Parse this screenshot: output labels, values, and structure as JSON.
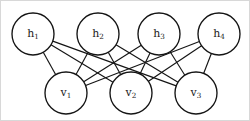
{
  "figure": {
    "background_color": "#ffffff",
    "border_color": "#d8d8d8",
    "stroke_color": "#141414"
  },
  "graph_data": {
    "type": "bipartite-graph",
    "layers": [
      {
        "name": "hidden",
        "y": 33,
        "radius": 21,
        "nodes": [
          {
            "id": "h1",
            "base": "h",
            "sub": "1",
            "x": 32,
            "y": 33
          },
          {
            "id": "h2",
            "base": "h",
            "sub": "2",
            "x": 97,
            "y": 33
          },
          {
            "id": "h3",
            "base": "h",
            "sub": "3",
            "x": 158,
            "y": 33
          },
          {
            "id": "h4",
            "base": "h",
            "sub": "4",
            "x": 218,
            "y": 33
          }
        ]
      },
      {
        "name": "visible",
        "y": 92,
        "radius": 21,
        "nodes": [
          {
            "id": "v1",
            "base": "v",
            "sub": "1",
            "x": 65,
            "y": 92
          },
          {
            "id": "v2",
            "base": "v",
            "sub": "2",
            "x": 130,
            "y": 92
          },
          {
            "id": "v3",
            "base": "v",
            "sub": "3",
            "x": 195,
            "y": 92
          }
        ]
      }
    ],
    "edges": [
      {
        "from": "h1",
        "to": "v1"
      },
      {
        "from": "h1",
        "to": "v2"
      },
      {
        "from": "h1",
        "to": "v3"
      },
      {
        "from": "h2",
        "to": "v1"
      },
      {
        "from": "h2",
        "to": "v2"
      },
      {
        "from": "h2",
        "to": "v3"
      },
      {
        "from": "h3",
        "to": "v1"
      },
      {
        "from": "h3",
        "to": "v2"
      },
      {
        "from": "h3",
        "to": "v3"
      },
      {
        "from": "h4",
        "to": "v1"
      },
      {
        "from": "h4",
        "to": "v2"
      },
      {
        "from": "h4",
        "to": "v3"
      }
    ],
    "edge_count": 12,
    "fully_connected": true
  }
}
